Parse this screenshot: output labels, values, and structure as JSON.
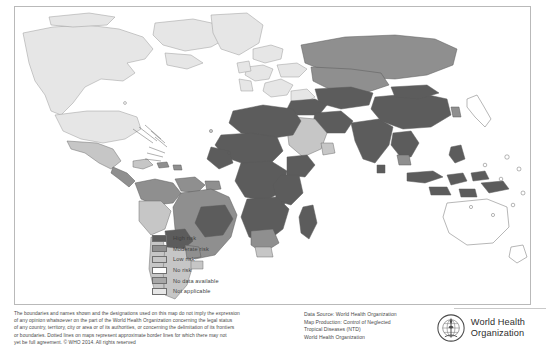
{
  "map": {
    "title": "",
    "side_code": "WHO 2014",
    "projection_note": "world map",
    "water_color": "#ffffff",
    "border_color": "#6f6f6f",
    "frame_color": "#b9b9b9"
  },
  "legend": {
    "items": [
      {
        "label": "High risk",
        "color": "#5c5c5c"
      },
      {
        "label": "Moderate risk",
        "color": "#8f8f8f"
      },
      {
        "label": "Low risk",
        "color": "#c6c6c6"
      },
      {
        "label": "No risk",
        "color": "#ffffff"
      },
      {
        "label": "No data available",
        "color": "#a8a8a8"
      },
      {
        "label": "Not applicable",
        "color": "#e6e6e6"
      }
    ]
  },
  "footer": {
    "disclaimer_lines": [
      "The boundaries and names shown and the designations used on this map do not imply the expression",
      "of any opinion whatsoever on the part of the World Health Organization concerning the legal status",
      "of any country, territory, city or area or of its authorities, or concerning the delimitation of its frontiers",
      "or boundaries. Dotted lines on maps represent approximate border lines for which there may not",
      "yet be full agreement. © WHO 2014. All rights reserved"
    ],
    "source_lines": [
      "Data Source: World Health Organization",
      "Map Production: Control of Neglected",
      "Tropical Diseases (NTD)",
      "World Health Organization"
    ],
    "who": {
      "line1": "World Health",
      "line2": "Organization",
      "emblem_name": "who-emblem"
    }
  }
}
